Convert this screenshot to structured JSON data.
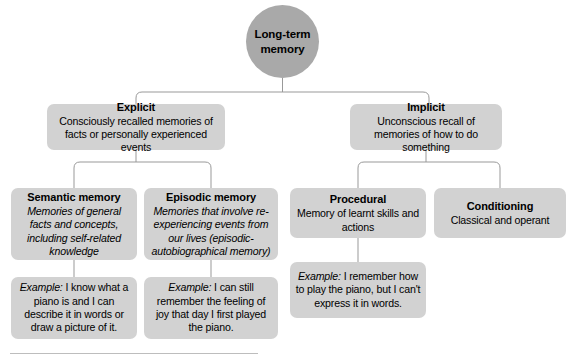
{
  "diagram": {
    "colors": {
      "root_fill": "#a9a9a9",
      "node_fill": "#d2d2d2",
      "connector": "#999999",
      "text": "#000000",
      "rule": "#bdbdbd"
    },
    "root": {
      "label": "Long-term memory"
    },
    "branches": {
      "explicit": {
        "title": "Explicit",
        "description": "Consciously recalled memories of facts or personally experienced events"
      },
      "implicit": {
        "title": "Implicit",
        "description": "Unconscious recall of memories of how to do something"
      }
    },
    "nodes": {
      "semantic": {
        "title": "Semantic memory",
        "description": "Memories of general facts and concepts, including self-related knowledge"
      },
      "episodic": {
        "title": "Episodic memory",
        "description": "Memories that involve re-experiencing events from our lives (episodic-autobiographical memory)"
      },
      "procedural": {
        "title": "Procedural",
        "description": "Memory of learnt skills and actions"
      },
      "conditioning": {
        "title": "Conditioning",
        "description": "Classical and operant"
      }
    },
    "examples": {
      "label": "Example",
      "semantic": {
        "label": "Example:",
        "text": " I know what a piano is and I can describe it in words or draw a picture of it."
      },
      "episodic": {
        "label": "Example:",
        "text": " I can still remember the feeling of joy that day I first played the piano."
      },
      "procedural": {
        "label": "Example:",
        "text": " I remember how to play the piano, but I can't express it in words."
      }
    }
  }
}
